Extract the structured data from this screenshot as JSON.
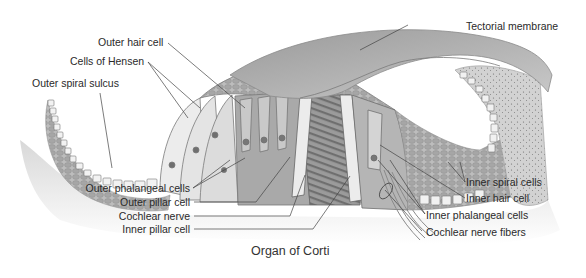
{
  "figure": {
    "caption": "Organ of Corti",
    "colors": {
      "background": "#ffffff",
      "tissue_light": "#e6e6e6",
      "tissue_mid": "#b9b9b9",
      "tissue_dark": "#7d7d7d",
      "leader_line": "#444444",
      "label_text": "#2a2a2a"
    }
  },
  "labels": {
    "outer_hair_cell": "Outer hair cell",
    "cells_of_hensen": "Cells of Hensen",
    "outer_spiral_sulcus": "Outer spiral sulcus",
    "tectorial_membrane": "Tectorial membrane",
    "outer_phalangeal_cells": "Outer phalangeal cells",
    "outer_pillar_cell": "Outer pillar cell",
    "cochlear_nerve": "Cochlear nerve",
    "inner_pillar_cell": "Inner pillar cell",
    "inner_spiral_cells": "Inner spiral cells",
    "inner_hair_cell": "Inner hair cell",
    "inner_phalangeal_cells": "Inner phalangeal cells",
    "cochlear_nerve_fibers": "Cochlear nerve fibers"
  }
}
